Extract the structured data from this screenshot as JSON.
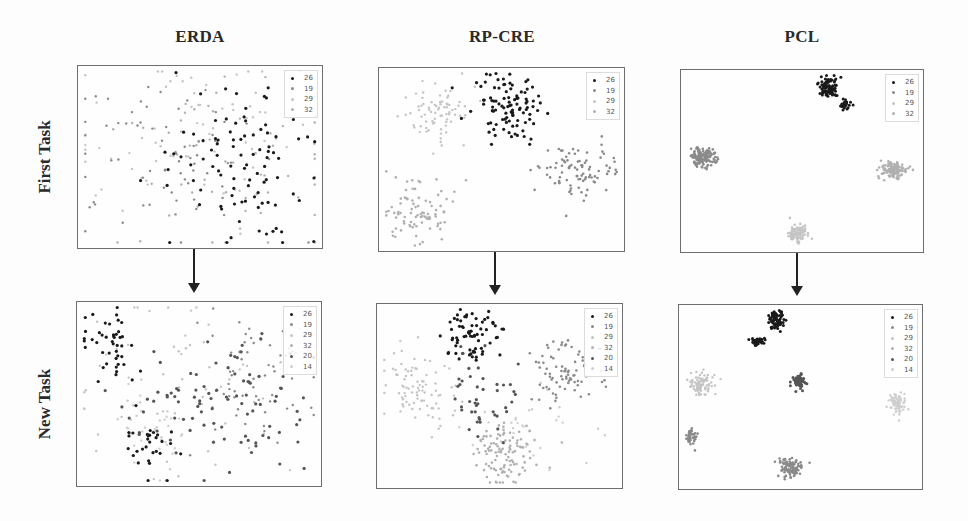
{
  "figure": {
    "columns": [
      "ERDA",
      "RP-CRE",
      "PCL"
    ],
    "rows": [
      "First Task",
      "New Task"
    ]
  },
  "legend_colors": {
    "26": "#1a1a1a",
    "19": "#8a8a8a",
    "29": "#c4c4c4",
    "32": "#b0b0b0",
    "20": "#555555",
    "14": "#cfcfcf"
  },
  "chart_data": [
    {
      "type": "scatter",
      "title": "ERDA",
      "row": "First Task",
      "legend": [
        "26",
        "19",
        "29",
        "32"
      ],
      "clusters": [
        {
          "label": "26",
          "cx": 0.68,
          "cy": 0.55,
          "sx": 0.16,
          "sy": 0.22,
          "n": 95,
          "size": 1.6
        },
        {
          "label": "19",
          "cx": 0.35,
          "cy": 0.5,
          "sx": 0.22,
          "sy": 0.22,
          "n": 70,
          "size": 1.2
        },
        {
          "label": "29",
          "cx": 0.45,
          "cy": 0.4,
          "sx": 0.25,
          "sy": 0.25,
          "n": 70,
          "size": 1.2
        },
        {
          "label": "32",
          "cx": 0.55,
          "cy": 0.5,
          "sx": 0.25,
          "sy": 0.25,
          "n": 60,
          "size": 1.2
        }
      ]
    },
    {
      "type": "scatter",
      "title": "RP-CRE",
      "row": "First Task",
      "legend": [
        "26",
        "19",
        "29",
        "32"
      ],
      "clusters": [
        {
          "label": "26",
          "cx": 0.53,
          "cy": 0.22,
          "sx": 0.07,
          "sy": 0.09,
          "n": 100,
          "size": 1.6
        },
        {
          "label": "19",
          "cx": 0.8,
          "cy": 0.55,
          "sx": 0.08,
          "sy": 0.07,
          "n": 90,
          "size": 1.3
        },
        {
          "label": "29",
          "cx": 0.23,
          "cy": 0.23,
          "sx": 0.07,
          "sy": 0.08,
          "n": 80,
          "size": 1.2
        },
        {
          "label": "32",
          "cx": 0.15,
          "cy": 0.78,
          "sx": 0.07,
          "sy": 0.08,
          "n": 90,
          "size": 1.3
        }
      ]
    },
    {
      "type": "scatter",
      "title": "PCL",
      "row": "First Task",
      "legend": [
        "26",
        "19",
        "29",
        "32"
      ],
      "clusters": [
        {
          "label": "26",
          "cx": 0.61,
          "cy": 0.1,
          "sx": 0.018,
          "sy": 0.03,
          "n": 90,
          "size": 1.5
        },
        {
          "label": "26",
          "cx": 0.68,
          "cy": 0.19,
          "sx": 0.01,
          "sy": 0.015,
          "n": 25,
          "size": 1.5
        },
        {
          "label": "19",
          "cx": 0.09,
          "cy": 0.48,
          "sx": 0.025,
          "sy": 0.025,
          "n": 140,
          "size": 1.3
        },
        {
          "label": "29",
          "cx": 0.48,
          "cy": 0.9,
          "sx": 0.02,
          "sy": 0.025,
          "n": 90,
          "size": 1.3
        },
        {
          "label": "32",
          "cx": 0.88,
          "cy": 0.55,
          "sx": 0.025,
          "sy": 0.02,
          "n": 120,
          "size": 1.3
        }
      ]
    },
    {
      "type": "scatter",
      "title": "ERDA",
      "row": "New Task",
      "legend": [
        "26",
        "19",
        "29",
        "32",
        "20",
        "14"
      ],
      "clusters": [
        {
          "label": "26",
          "cx": 0.14,
          "cy": 0.22,
          "sx": 0.07,
          "sy": 0.1,
          "n": 45,
          "size": 1.6
        },
        {
          "label": "20",
          "cx": 0.4,
          "cy": 0.55,
          "sx": 0.15,
          "sy": 0.12,
          "n": 40,
          "size": 1.6
        },
        {
          "label": "20",
          "cx": 0.72,
          "cy": 0.55,
          "sx": 0.13,
          "sy": 0.22,
          "n": 55,
          "size": 1.6
        },
        {
          "label": "26",
          "cx": 0.3,
          "cy": 0.78,
          "sx": 0.05,
          "sy": 0.1,
          "n": 30,
          "size": 1.6
        },
        {
          "label": "19",
          "cx": 0.7,
          "cy": 0.45,
          "sx": 0.14,
          "sy": 0.2,
          "n": 60,
          "size": 1.2
        },
        {
          "label": "29",
          "cx": 0.45,
          "cy": 0.45,
          "sx": 0.22,
          "sy": 0.25,
          "n": 60,
          "size": 1.2
        },
        {
          "label": "14",
          "cx": 0.3,
          "cy": 0.7,
          "sx": 0.1,
          "sy": 0.12,
          "n": 40,
          "size": 1.2
        }
      ]
    },
    {
      "type": "scatter",
      "title": "RP-CRE",
      "row": "New Task",
      "legend": [
        "26",
        "19",
        "29",
        "32",
        "20",
        "14"
      ],
      "clusters": [
        {
          "label": "26",
          "cx": 0.38,
          "cy": 0.18,
          "sx": 0.05,
          "sy": 0.07,
          "n": 70,
          "size": 1.6
        },
        {
          "label": "20",
          "cx": 0.43,
          "cy": 0.5,
          "sx": 0.06,
          "sy": 0.14,
          "n": 45,
          "size": 1.6
        },
        {
          "label": "19",
          "cx": 0.78,
          "cy": 0.38,
          "sx": 0.07,
          "sy": 0.09,
          "n": 80,
          "size": 1.3
        },
        {
          "label": "29",
          "cx": 0.16,
          "cy": 0.45,
          "sx": 0.08,
          "sy": 0.12,
          "n": 90,
          "size": 1.2
        },
        {
          "label": "32",
          "cx": 0.52,
          "cy": 0.8,
          "sx": 0.06,
          "sy": 0.09,
          "n": 110,
          "size": 1.3
        },
        {
          "label": "14",
          "cx": 0.6,
          "cy": 0.65,
          "sx": 0.12,
          "sy": 0.1,
          "n": 30,
          "size": 1.2
        }
      ]
    },
    {
      "type": "scatter",
      "title": "PCL",
      "row": "New Task",
      "legend": [
        "26",
        "19",
        "29",
        "32",
        "20",
        "14"
      ],
      "clusters": [
        {
          "label": "26",
          "cx": 0.4,
          "cy": 0.08,
          "sx": 0.015,
          "sy": 0.025,
          "n": 70,
          "size": 1.5
        },
        {
          "label": "26",
          "cx": 0.32,
          "cy": 0.2,
          "sx": 0.015,
          "sy": 0.012,
          "n": 40,
          "size": 1.5
        },
        {
          "label": "20",
          "cx": 0.49,
          "cy": 0.42,
          "sx": 0.015,
          "sy": 0.02,
          "n": 50,
          "size": 1.5
        },
        {
          "label": "19",
          "cx": 0.05,
          "cy": 0.71,
          "sx": 0.012,
          "sy": 0.02,
          "n": 40,
          "size": 1.3
        },
        {
          "label": "19",
          "cx": 0.46,
          "cy": 0.88,
          "sx": 0.025,
          "sy": 0.025,
          "n": 100,
          "size": 1.3
        },
        {
          "label": "29",
          "cx": 0.09,
          "cy": 0.43,
          "sx": 0.025,
          "sy": 0.03,
          "n": 90,
          "size": 1.2
        },
        {
          "label": "14",
          "cx": 0.9,
          "cy": 0.54,
          "sx": 0.02,
          "sy": 0.03,
          "n": 80,
          "size": 1.2
        }
      ]
    }
  ],
  "panels": [
    {
      "left": 77,
      "top": 65,
      "width": 246,
      "height": 184
    },
    {
      "left": 378,
      "top": 67,
      "width": 247,
      "height": 185
    },
    {
      "left": 680,
      "top": 69,
      "width": 244,
      "height": 184
    },
    {
      "left": 76,
      "top": 301,
      "width": 246,
      "height": 186
    },
    {
      "left": 376,
      "top": 303,
      "width": 247,
      "height": 186
    },
    {
      "left": 678,
      "top": 304,
      "width": 245,
      "height": 186
    }
  ]
}
